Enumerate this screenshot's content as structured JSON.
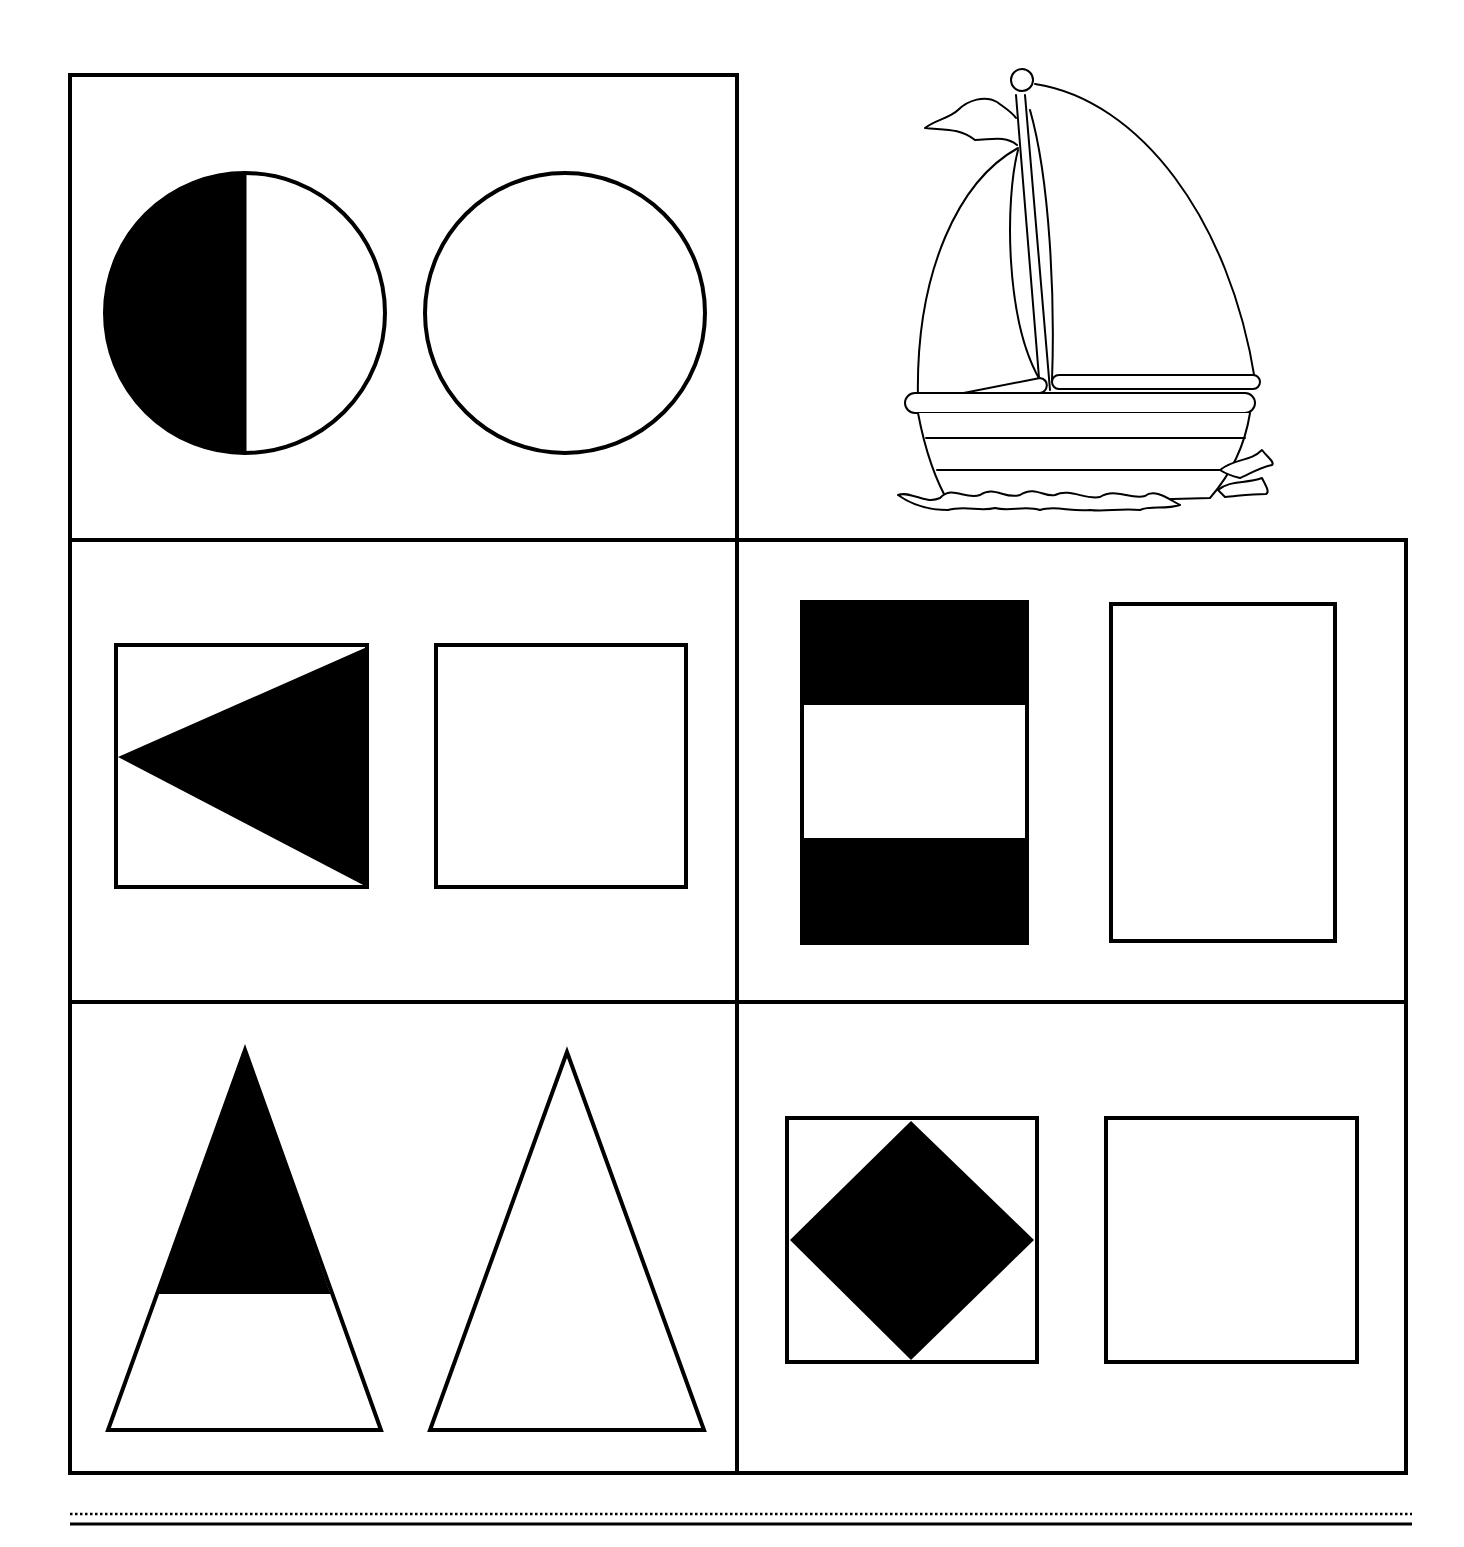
{
  "worksheet": {
    "type": "shape-symmetry-copy-activity",
    "ink_color": "#000000",
    "paper_color": "#ffffff",
    "cells": [
      {
        "id": "cell-circles",
        "position": "top-left",
        "example_shape": "circle",
        "example_fill": "left half filled black",
        "answer_shape": "empty circle"
      },
      {
        "id": "cell-boat-illustration",
        "position": "top-right",
        "illustration": "sailboat on waves",
        "bordered": false
      },
      {
        "id": "cell-squares-triangle",
        "position": "middle-left",
        "example_shape": "square",
        "example_fill": "left-pointing triangle filled black",
        "answer_shape": "empty square"
      },
      {
        "id": "cell-rectangles-bands",
        "position": "middle-right",
        "example_shape": "tall rectangle",
        "example_fill": "top and bottom bands filled black",
        "answer_shape": "empty tall rectangle"
      },
      {
        "id": "cell-triangles",
        "position": "bottom-left",
        "example_shape": "tall triangle",
        "example_fill": "top portion filled black",
        "answer_shape": "empty tall triangle"
      },
      {
        "id": "cell-squares-diamond",
        "position": "bottom-right",
        "example_shape": "square",
        "example_fill": "inscribed diamond filled black",
        "answer_shape": "empty square"
      }
    ]
  },
  "footer": {
    "rule_style": "dotted line above solid line"
  }
}
